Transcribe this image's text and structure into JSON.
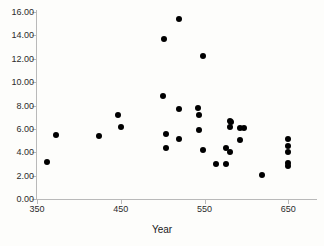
{
  "chart_data": {
    "type": "scatter",
    "title": "",
    "xlabel": "Year",
    "ylabel": "",
    "xlim": [
      350,
      683
    ],
    "ylim": [
      0.0,
      16.0
    ],
    "grid": false,
    "legend": null,
    "xticks": [
      350,
      450,
      550,
      650
    ],
    "xtick_labels": [
      "350",
      "450",
      "550",
      "650"
    ],
    "yticks": [
      0.0,
      2.0,
      4.0,
      6.0,
      8.0,
      10.0,
      12.0,
      14.0,
      16.0
    ],
    "ytick_labels": [
      "0.00",
      "2.00",
      "4.00",
      "6.00",
      "8.00",
      "10.00",
      "12.00",
      "14.00",
      "16.00"
    ],
    "marker": "filled-circle",
    "marker_color": "#000000",
    "points": [
      {
        "x": 362,
        "y": 3.2
      },
      {
        "x": 373,
        "y": 5.5
      },
      {
        "x": 424,
        "y": 5.35
      },
      {
        "x": 447,
        "y": 7.15
      },
      {
        "x": 450,
        "y": 6.15
      },
      {
        "x": 500,
        "y": 8.8
      },
      {
        "x": 501,
        "y": 13.7
      },
      {
        "x": 504,
        "y": 5.6
      },
      {
        "x": 504,
        "y": 4.4
      },
      {
        "x": 519,
        "y": 15.4
      },
      {
        "x": 520,
        "y": 7.7
      },
      {
        "x": 519,
        "y": 5.1
      },
      {
        "x": 542,
        "y": 7.75
      },
      {
        "x": 543,
        "y": 7.15
      },
      {
        "x": 543,
        "y": 5.9
      },
      {
        "x": 548,
        "y": 12.25
      },
      {
        "x": 548,
        "y": 4.2
      },
      {
        "x": 564,
        "y": 3.0
      },
      {
        "x": 576,
        "y": 3.0
      },
      {
        "x": 575,
        "y": 4.4
      },
      {
        "x": 580,
        "y": 4.05
      },
      {
        "x": 580,
        "y": 6.7
      },
      {
        "x": 581,
        "y": 6.55
      },
      {
        "x": 580,
        "y": 6.15
      },
      {
        "x": 592,
        "y": 6.1
      },
      {
        "x": 597,
        "y": 6.1
      },
      {
        "x": 592,
        "y": 5.05
      },
      {
        "x": 619,
        "y": 2.05
      },
      {
        "x": 650,
        "y": 5.1
      },
      {
        "x": 650,
        "y": 4.55
      },
      {
        "x": 650,
        "y": 4.0
      },
      {
        "x": 650,
        "y": 3.1
      },
      {
        "x": 650,
        "y": 2.8
      }
    ]
  }
}
